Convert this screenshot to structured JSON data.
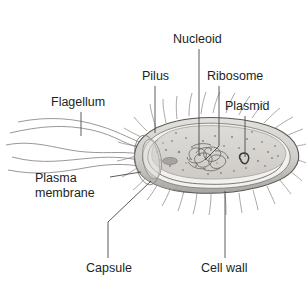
{
  "figure": {
    "organism": "rod-shaped bacterium",
    "background_color": "#ffffff",
    "ink_color": "#231f20",
    "leader_color": "#4a4a4a"
  },
  "labels": [
    {
      "id": "nucleoid",
      "text": "Nucleoid",
      "x": 173,
      "y": 33,
      "lines": [
        "Nucleoid"
      ]
    },
    {
      "id": "pilus",
      "text": "Pilus",
      "x": 142,
      "y": 70,
      "lines": [
        "Pilus"
      ]
    },
    {
      "id": "ribosome",
      "text": "Ribosome",
      "x": 207,
      "y": 70,
      "lines": [
        "Ribosome"
      ]
    },
    {
      "id": "plasmid",
      "text": "Plasmid",
      "x": 225,
      "y": 100,
      "lines": [
        "Plasmid"
      ]
    },
    {
      "id": "flagellum",
      "text": "Flagellum",
      "x": 51,
      "y": 96,
      "lines": [
        "Flagellum"
      ]
    },
    {
      "id": "plasma-membrane",
      "text": "Plasma membrane",
      "x": 35,
      "y": 171,
      "lines": [
        "Plasma",
        "membrane"
      ]
    },
    {
      "id": "capsule",
      "text": "Capsule",
      "x": 86,
      "y": 262,
      "lines": [
        "Capsule"
      ]
    },
    {
      "id": "cell-wall",
      "text": "Cell wall",
      "x": 201,
      "y": 262,
      "lines": [
        "Cell wall"
      ]
    }
  ],
  "palette": {
    "capsule_fill": "#cfcdc9",
    "capsule_shade": "#b3b1ad",
    "wall_fill": "#f2f1ef",
    "cytoplasm_fill": "#d9d7d3",
    "cytoplasm_speckle": "#8d8a86",
    "nucleoid_stroke": "#6e6b67",
    "plasmid_stroke": "#3a3836",
    "outline": "#5a5754",
    "pili_stroke": "#8f8c88",
    "flagellum_stroke": "#8f8c88"
  },
  "structures": [
    {
      "id": "capsule",
      "description": "outermost gray sheath enclosing the rod"
    },
    {
      "id": "cell-wall",
      "description": "layer beneath the capsule"
    },
    {
      "id": "plasma-membrane",
      "description": "pale band lining the inside of the wall"
    },
    {
      "id": "cytoplasm",
      "description": "speckled gray interior"
    },
    {
      "id": "nucleoid",
      "description": "tangled loop of chromosomal DNA near cell centre"
    },
    {
      "id": "plasmid",
      "description": "small closed DNA loop right of the nucleoid"
    },
    {
      "id": "ribosomes",
      "description": "dark dots scattered through the cytoplasm"
    },
    {
      "id": "pili",
      "description": "short hair-like projections all around the cell"
    },
    {
      "id": "flagella",
      "description": "long wavy filaments extending to the left"
    }
  ]
}
